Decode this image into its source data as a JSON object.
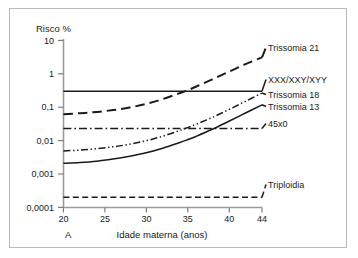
{
  "figure": {
    "panel_label": "A",
    "frame_color": "#b9b9b9",
    "background": "#ffffff",
    "line_color": "#1a1a1a"
  },
  "chart_data": {
    "type": "line",
    "title": "",
    "ylabel": "Risco %",
    "xlabel": "Idade materna (anos)",
    "yscale": "log",
    "xlim": [
      20,
      44
    ],
    "ylim": [
      0.0001,
      10
    ],
    "grid": false,
    "legend_position": "right-inline",
    "xticks": [
      20,
      25,
      30,
      35,
      40,
      44
    ],
    "xticklabels": [
      "20",
      "25",
      "30",
      "35",
      "40",
      "44"
    ],
    "yticks": [
      10,
      1,
      0.1,
      0.01,
      0.001,
      0.0001
    ],
    "yticklabels": [
      "10",
      "1",
      "0,1",
      "0,01",
      "0,001",
      "0,0001"
    ],
    "x": [
      20,
      22,
      24,
      26,
      28,
      30,
      32,
      34,
      35,
      36,
      38,
      40,
      42,
      44
    ],
    "series": [
      {
        "name": "Trissomia 21",
        "label": "Trissomia 21",
        "style": "long-dash",
        "values": [
          0.062,
          0.066,
          0.072,
          0.082,
          0.098,
          0.125,
          0.175,
          0.26,
          0.32,
          0.41,
          0.68,
          1.15,
          1.95,
          3.1
        ]
      },
      {
        "name": "XXX/XXY/XYY",
        "label": "XXX/XXY/XYY",
        "style": "solid",
        "values": [
          0.3,
          0.3,
          0.3,
          0.3,
          0.3,
          0.3,
          0.3,
          0.3,
          0.3,
          0.3,
          0.3,
          0.3,
          0.3,
          0.3
        ]
      },
      {
        "name": "Trissomia 18",
        "label": "Trissomia 18",
        "style": "dash-dot-dot",
        "values": [
          0.0049,
          0.0052,
          0.0057,
          0.0065,
          0.0078,
          0.0099,
          0.0135,
          0.0198,
          0.0245,
          0.0305,
          0.0495,
          0.085,
          0.15,
          0.265
        ]
      },
      {
        "name": "Trissomia 13",
        "label": "Trissomia 13",
        "style": "solid",
        "values": [
          0.0021,
          0.0022,
          0.0024,
          0.0028,
          0.0034,
          0.0043,
          0.0059,
          0.0086,
          0.0106,
          0.0133,
          0.0218,
          0.038,
          0.067,
          0.118
        ]
      },
      {
        "name": "45x0",
        "label": "45x0",
        "style": "dash-dot",
        "values": [
          0.023,
          0.023,
          0.023,
          0.023,
          0.023,
          0.023,
          0.023,
          0.023,
          0.023,
          0.023,
          0.023,
          0.023,
          0.023,
          0.023
        ]
      },
      {
        "name": "Triploidia",
        "label": "Triploidia",
        "style": "dashed",
        "values": [
          0.0002,
          0.0002,
          0.0002,
          0.0002,
          0.0002,
          0.0002,
          0.0002,
          0.0002,
          0.0002,
          0.0002,
          0.0002,
          0.0002,
          0.0002,
          0.0002
        ]
      }
    ]
  }
}
